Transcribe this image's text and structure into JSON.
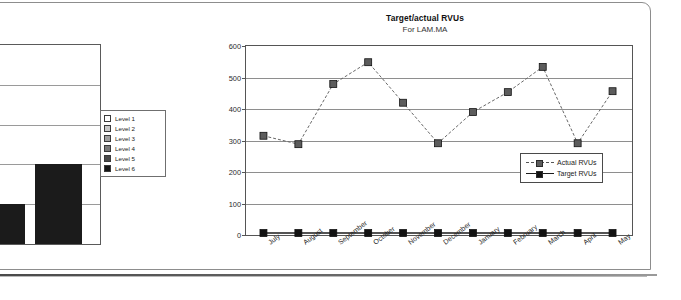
{
  "document": {
    "frame_color": "#8d8d8d"
  },
  "bar_chart": {
    "name": "levels-bar-chart",
    "clipped": true,
    "legend": {
      "items": [
        {
          "label": "Level 1",
          "color": "#ffffff"
        },
        {
          "label": "Level 2",
          "color": "#c9c9c9"
        },
        {
          "label": "Level 3",
          "color": "#a0a0a0"
        },
        {
          "label": "Level 4",
          "color": "#7a7a7a"
        },
        {
          "label": "Level 5",
          "color": "#4a4a4a"
        },
        {
          "label": "Level 6",
          "color": "#151515"
        }
      ]
    },
    "chart_data": {
      "type": "bar",
      "title": "",
      "xlabel": "",
      "ylabel": "",
      "grid": true,
      "ylim": [
        0,
        5
      ],
      "categories": [
        "Level 5",
        "Level 6"
      ],
      "values": [
        1.0,
        2.0
      ],
      "colors": [
        "#1b1b1b",
        "#1b1b1b"
      ],
      "note": "Chart is cropped at the left edge of the screenshot; only the two rightmost bars and the legend are visible."
    }
  },
  "line_chart": {
    "title": "Target/actual RVUs",
    "subtitle": "For LAM.MA",
    "legend": {
      "items": [
        {
          "label": "Actual RVUs",
          "style": "dashed",
          "marker_color": "#5c5c5c"
        },
        {
          "label": "Target RVUs",
          "style": "solid",
          "marker_color": "#121212"
        }
      ]
    },
    "chart_data": {
      "type": "line",
      "title": "Target/actual RVUs",
      "subtitle": "For LAM.MA",
      "xlabel": "",
      "ylabel": "",
      "grid": true,
      "ylim": [
        0,
        600
      ],
      "yticks": [
        0,
        100,
        200,
        300,
        400,
        500,
        600
      ],
      "legend_position": "inside-bottom-right",
      "categories": [
        "July",
        "August",
        "September",
        "October",
        "November",
        "December",
        "January",
        "February",
        "March",
        "April",
        "May"
      ],
      "series": [
        {
          "name": "Actual RVUs",
          "style": "dashed",
          "marker": "square",
          "color": "#5c5c5c",
          "values": [
            312,
            285,
            478,
            548,
            418,
            288,
            388,
            452,
            533,
            288,
            455
          ]
        },
        {
          "name": "Target RVUs",
          "style": "solid",
          "marker": "square",
          "color": "#121212",
          "values": [
            0,
            0,
            0,
            0,
            0,
            0,
            0,
            0,
            0,
            0,
            0
          ]
        }
      ]
    }
  }
}
